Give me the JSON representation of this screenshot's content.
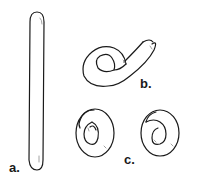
{
  "figure": {
    "labels": {
      "a": "a.",
      "b": "b.",
      "c": "c."
    },
    "parts": [
      {
        "id": "a",
        "description": "straight rolled coil"
      },
      {
        "id": "b",
        "description": "coil beginning to curl"
      },
      {
        "id": "c",
        "description": "two finished spiral coils"
      }
    ],
    "colors": {
      "stroke": "#1a1a1a",
      "background": "#ffffff",
      "highlight": "#8a8a8a"
    }
  }
}
